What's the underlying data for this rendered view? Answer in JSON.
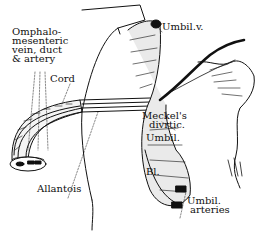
{
  "figure": {
    "type": "anatomical line drawing",
    "ink_color": "#111111",
    "background": "#ffffff"
  },
  "labels": {
    "omphalo_line1": "Omphalo-",
    "omphalo_line2": "mesenteric",
    "omphalo_line3": "vein, duct",
    "omphalo_line4": "& artery",
    "cord": "Cord",
    "umbil_v": "Umbil.v.",
    "meckels_line1": "Meckel's",
    "meckels_line2": "divrtic.",
    "umbil": "Umbil.",
    "bl": "Bl.",
    "umbil_arteries_line1": "Umbil.",
    "umbil_arteries_line2": "arteries",
    "allantois": "Allantois"
  }
}
